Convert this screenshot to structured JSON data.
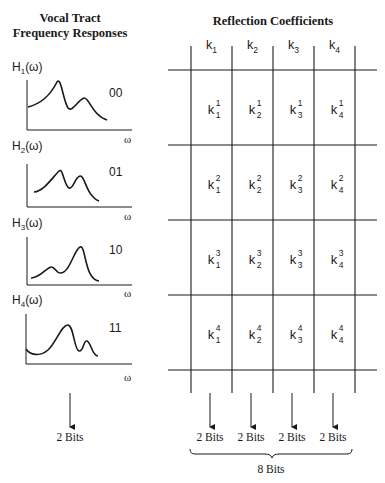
{
  "left_panel": {
    "title_line1": "Vocal Tract",
    "title_line2": "Frequency Responses",
    "responses": [
      {
        "label": "H",
        "index": "1",
        "arg": "(ω)",
        "code": "00",
        "axis_label": "ω"
      },
      {
        "label": "H",
        "index": "2",
        "arg": "(ω)",
        "code": "01",
        "axis_label": "ω"
      },
      {
        "label": "H",
        "index": "3",
        "arg": "(ω)",
        "code": "10",
        "axis_label": "ω"
      },
      {
        "label": "H",
        "index": "4",
        "arg": "(ω)",
        "code": "11",
        "axis_label": "ω"
      }
    ],
    "bits_label": "2 Bits"
  },
  "right_panel": {
    "title": "Reflection Coefficients",
    "columns": [
      {
        "base": "k",
        "index": "1"
      },
      {
        "base": "k",
        "index": "2"
      },
      {
        "base": "k",
        "index": "3"
      },
      {
        "base": "k",
        "index": "4"
      }
    ],
    "rows": [
      [
        "1",
        "1",
        "1",
        "1"
      ],
      [
        "2",
        "2",
        "2",
        "2"
      ],
      [
        "3",
        "3",
        "3",
        "3"
      ],
      [
        "4",
        "4",
        "4",
        "4"
      ]
    ],
    "column_bits": [
      "2 Bits",
      "2 Bits",
      "2 Bits",
      "2 Bits"
    ],
    "total_bits": "8 Bits"
  },
  "colors": {
    "line": "#1a1a1a",
    "background": "#ffffff"
  }
}
